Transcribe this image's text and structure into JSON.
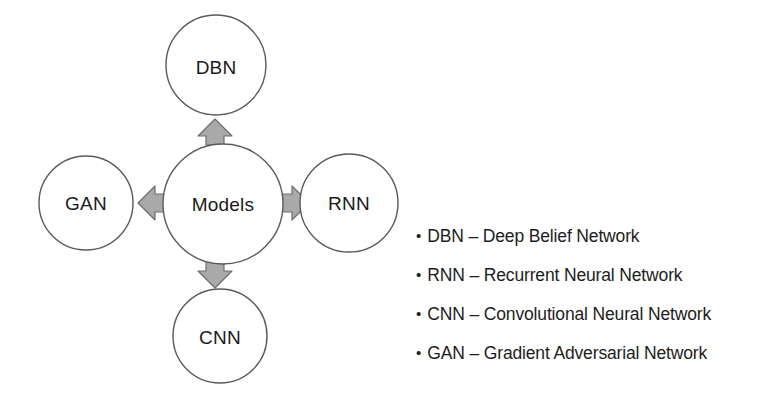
{
  "diagram": {
    "type": "hub-and-spoke",
    "center": {
      "id": "models",
      "label": "Models"
    },
    "nodes": [
      {
        "id": "dbn",
        "label": "DBN",
        "position": "top"
      },
      {
        "id": "gan",
        "label": "GAN",
        "position": "left"
      },
      {
        "id": "rnn",
        "label": "RNN",
        "position": "right"
      },
      {
        "id": "cnn",
        "label": "CNN",
        "position": "bottom"
      }
    ],
    "arrows": [
      {
        "id": "arrow-up",
        "direction": "up",
        "from": "models",
        "to": "dbn"
      },
      {
        "id": "arrow-left",
        "direction": "left",
        "from": "models",
        "to": "gan"
      },
      {
        "id": "arrow-right",
        "direction": "right",
        "from": "models",
        "to": "rnn"
      },
      {
        "id": "arrow-down",
        "direction": "down",
        "from": "models",
        "to": "cnn"
      }
    ],
    "colors": {
      "background": "#ffffff",
      "circle_fill": "#ffffff",
      "circle_stroke": "#5a5a5a",
      "arrow_fill": "#a9a9a9",
      "arrow_stroke": "#6e6e6e",
      "text": "#1d1d1d"
    }
  },
  "legend": {
    "bullet": "•",
    "items": [
      {
        "abbr": "DBN",
        "text": "DBN – Deep Belief Network"
      },
      {
        "abbr": "RNN",
        "text": "RNN – Recurrent Neural Network"
      },
      {
        "abbr": "CNN",
        "text": "CNN – Convolutional Neural Network"
      },
      {
        "abbr": "GAN",
        "text": "GAN – Gradient Adversarial Network"
      }
    ]
  }
}
